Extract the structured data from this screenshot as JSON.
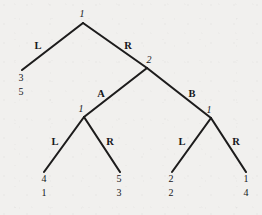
{
  "diagram": {
    "type": "extensive-form-game-tree",
    "background_color": "#f1f0ee",
    "line_color": "#1d1c1c",
    "text_color": "#16161a",
    "width": 262,
    "height": 215
  },
  "nodes": [
    {
      "id": "root",
      "player_label": "1",
      "x": 83,
      "y": 23,
      "label_x": 82,
      "label_y": 9
    },
    {
      "id": "node2",
      "player_label": "2",
      "x": 147,
      "y": 68,
      "label_x": 149,
      "label_y": 55
    },
    {
      "id": "node1-left",
      "player_label": "1",
      "x": 84,
      "y": 117,
      "label_x": 81,
      "label_y": 104
    },
    {
      "id": "node1-right",
      "player_label": "1",
      "x": 211,
      "y": 118,
      "label_x": 209,
      "label_y": 105
    }
  ],
  "branches": [
    {
      "id": "root-L",
      "action": "L",
      "from_x": 83,
      "from_y": 23,
      "to_x": 22,
      "to_y": 70,
      "label_x": 38,
      "label_y": 41
    },
    {
      "id": "root-R",
      "action": "R",
      "from_x": 83,
      "from_y": 23,
      "to_x": 147,
      "to_y": 68,
      "label_x": 128,
      "label_y": 41
    },
    {
      "id": "n2-A",
      "action": "A",
      "from_x": 147,
      "from_y": 68,
      "to_x": 84,
      "to_y": 117,
      "label_x": 101,
      "label_y": 89
    },
    {
      "id": "n2-B",
      "action": "B",
      "from_x": 147,
      "from_y": 68,
      "to_x": 211,
      "to_y": 118,
      "label_x": 192,
      "label_y": 89
    },
    {
      "id": "n1l-L",
      "action": "L",
      "from_x": 84,
      "from_y": 117,
      "to_x": 44,
      "to_y": 172,
      "label_x": 55,
      "label_y": 137
    },
    {
      "id": "n1l-R",
      "action": "R",
      "from_x": 84,
      "from_y": 117,
      "to_x": 120,
      "to_y": 172,
      "label_x": 110,
      "label_y": 137
    },
    {
      "id": "n1r-L",
      "action": "L",
      "from_x": 211,
      "from_y": 118,
      "to_x": 172,
      "to_y": 172,
      "label_x": 182,
      "label_y": 137
    },
    {
      "id": "n1r-R",
      "action": "R",
      "from_x": 211,
      "from_y": 118,
      "to_x": 246,
      "to_y": 172,
      "label_x": 236,
      "label_y": 137
    }
  ],
  "payoffs": [
    {
      "id": "payoff-root-L",
      "player1": "3",
      "player2": "5",
      "x": 21,
      "y": 73
    },
    {
      "id": "payoff-n1l-L",
      "player1": "4",
      "player2": "1",
      "x": 44,
      "y": 174
    },
    {
      "id": "payoff-n1l-R",
      "player1": "5",
      "player2": "3",
      "x": 119,
      "y": 174
    },
    {
      "id": "payoff-n1r-L",
      "player1": "2",
      "player2": "2",
      "x": 171,
      "y": 174
    },
    {
      "id": "payoff-n1r-R",
      "player1": "1",
      "player2": "4",
      "x": 246,
      "y": 174
    }
  ],
  "chart_data": {
    "type": "tree",
    "title": "",
    "root": {
      "player": "1",
      "children": [
        {
          "action": "L",
          "payoff": [
            "3",
            "5"
          ]
        },
        {
          "action": "R",
          "player": "2",
          "children": [
            {
              "action": "A",
              "player": "1",
              "children": [
                {
                  "action": "L",
                  "payoff": [
                    "4",
                    "1"
                  ]
                },
                {
                  "action": "R",
                  "payoff": [
                    "5",
                    "3"
                  ]
                }
              ]
            },
            {
              "action": "B",
              "player": "1",
              "children": [
                {
                  "action": "L",
                  "payoff": [
                    "2",
                    "2"
                  ]
                },
                {
                  "action": "R",
                  "payoff": [
                    "1",
                    "4"
                  ]
                }
              ]
            }
          ]
        }
      ]
    }
  }
}
